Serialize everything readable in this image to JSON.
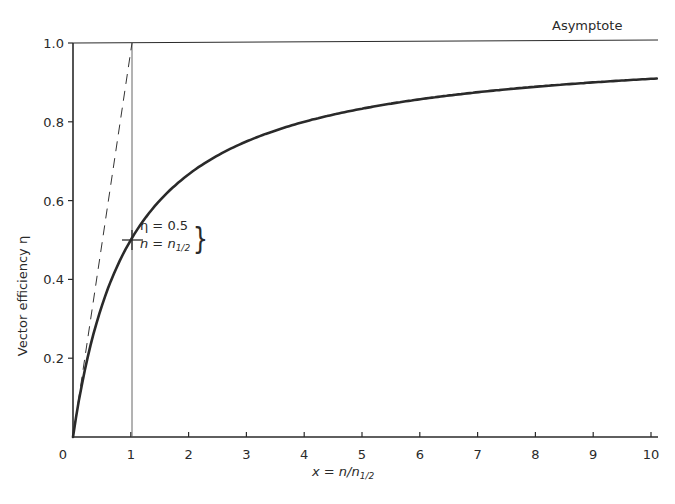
{
  "chart_data": {
    "type": "line",
    "title": "",
    "xlabel": "x = n/n1/2",
    "ylabel": "Vector efficiency η",
    "xlim": [
      0,
      10
    ],
    "ylim": [
      0,
      1.0
    ],
    "grid": false,
    "x_ticks": [
      "0",
      "1",
      "2",
      "3",
      "4",
      "5",
      "6",
      "7",
      "8",
      "9",
      "10"
    ],
    "y_ticks": [
      "0.2",
      "0.4",
      "0.6",
      "0.8",
      "1.0"
    ],
    "series": [
      {
        "name": "η = x/(1+x)",
        "style": "solid-thick",
        "x": [
          0,
          0.25,
          0.5,
          1,
          1.5,
          2,
          3,
          4,
          5,
          6,
          7,
          8,
          9,
          10
        ],
        "values": [
          0,
          0.2,
          0.333,
          0.5,
          0.6,
          0.667,
          0.75,
          0.8,
          0.833,
          0.857,
          0.875,
          0.889,
          0.9,
          0.909
        ]
      },
      {
        "name": "Initial slope (tangent)",
        "style": "dashed",
        "x": [
          0,
          1
        ],
        "values": [
          0,
          1.0
        ]
      },
      {
        "name": "Asymptote",
        "style": "thin",
        "x": [
          0,
          10
        ],
        "values": [
          1.0,
          1.0
        ]
      }
    ],
    "reference_lines": [
      {
        "type": "vertical",
        "x": 1,
        "style": "thin"
      }
    ],
    "annotations": [
      {
        "text": "Asymptote",
        "x": 8.3,
        "y": 1.02
      },
      {
        "text": "η = 0.5",
        "x": 1.1,
        "y": 0.54
      },
      {
        "text": "n = n1/2",
        "x": 1.1,
        "y": 0.49
      }
    ],
    "marked_point": {
      "x": 1,
      "y": 0.5,
      "marker": "cross"
    }
  },
  "labels": {
    "ylabel": "Vector efficiency η",
    "xlabel_main": "x = n/n",
    "xlabel_sub": "1/2",
    "asymptote": "Asymptote",
    "annot_eta": "η = 0.5",
    "annot_n_main": "n = n",
    "annot_n_sub": "1/2",
    "brace": "}"
  },
  "colors": {
    "ink": "#2a2a2a",
    "background": "#ffffff"
  }
}
